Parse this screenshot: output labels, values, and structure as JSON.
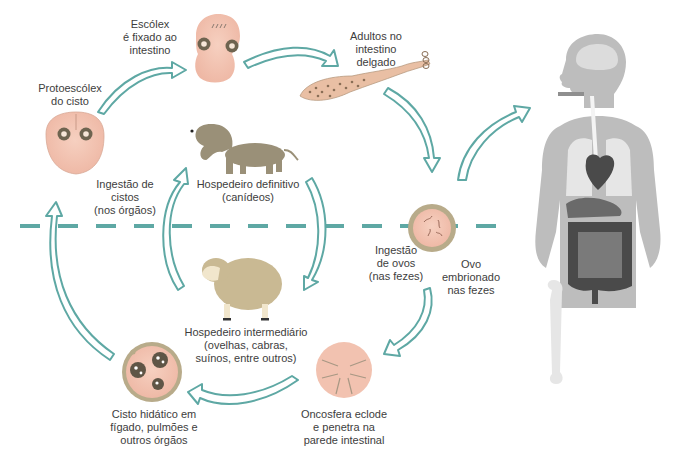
{
  "diagram": {
    "type": "life-cycle",
    "colors": {
      "arrow": "#5ea8a4",
      "arrow_fill": "#ffffff",
      "divider": "#5ea8a4",
      "organism_pink": "#f2c2b0",
      "organism_dark": "#6e6450",
      "cyst_rim": "#b8ab8a",
      "dog": "#9a9078",
      "sheep": "#c9b993",
      "body_gray": "#bdbdbd",
      "organ_dark": "#4a4a4a"
    },
    "nodes": {
      "scolex": {
        "lines": [
          "Escólex",
          "é fixado ao",
          "intestino"
        ]
      },
      "adults": {
        "lines": [
          "Adultos no",
          "intestino",
          "delgado"
        ]
      },
      "protoscolex": {
        "lines": [
          "Protoescólex",
          "do cisto"
        ]
      },
      "definitive_host": {
        "lines": [
          "Hospedeiro definitivo",
          "(canídeos)"
        ]
      },
      "cyst_ingestion": {
        "lines": [
          "Ingestão de",
          "cistos",
          "(nos órgãos)"
        ]
      },
      "egg_ingestion": {
        "lines": [
          "Ingestão",
          "de ovos",
          "(nas fezes)"
        ]
      },
      "embryonated_egg": {
        "lines": [
          "Ovo",
          "embrionado",
          "nas fezes"
        ]
      },
      "intermediate_host": {
        "lines": [
          "Hospedeiro intermediário",
          "(ovelhas, cabras,",
          "suínos, entre outros)"
        ]
      },
      "hydatid_cyst": {
        "lines": [
          "Cisto hidático em",
          "fígado, pulmões e",
          "outros órgãos"
        ]
      },
      "oncosphere": {
        "lines": [
          "Oncosfera eclode",
          "e penetra na",
          "parede intestinal"
        ]
      }
    },
    "figures": [
      "scolex-icon",
      "adult-tapeworm-icon",
      "protoscolex-icon",
      "dog-icon",
      "egg-icon",
      "sheep-icon",
      "hydatid-cyst-icon",
      "oncosphere-icon",
      "human-body-icon"
    ]
  }
}
